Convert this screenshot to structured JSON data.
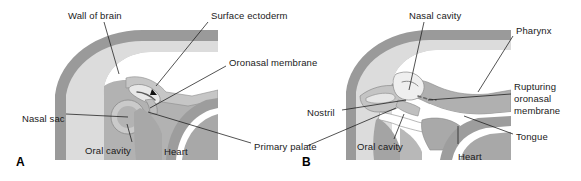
{
  "figure": {
    "type": "anatomical-diagram",
    "background_color": "#ffffff",
    "panel_count": 2
  },
  "colors": {
    "tissue_dark_gray": "#9a9a9a",
    "tissue_mid_gray": "#b5b5b5",
    "tissue_light_gray": "#cfcfcf",
    "tissue_pale": "#e4e4e4",
    "cavity_white": "#ffffff",
    "outline": "#6f6f6f",
    "leader_line": "#1a1a1a",
    "text": "#1a1a1a"
  },
  "panels": [
    {
      "letter": "A",
      "letter_x": 16,
      "letter_y": 155,
      "labels": [
        {
          "text": "Wall of brain",
          "x": 68,
          "y": 10,
          "anchor": "left"
        },
        {
          "text": "Surface ectoderm",
          "x": 211,
          "y": 10,
          "anchor": "left"
        },
        {
          "text": "Oronasal membrane",
          "x": 229,
          "y": 57,
          "anchor": "left"
        },
        {
          "text": "Nasal sac",
          "x": 22,
          "y": 113,
          "anchor": "left"
        },
        {
          "text": "Oral cavity",
          "x": 85,
          "y": 145,
          "anchor": "left"
        },
        {
          "text": "Heart",
          "x": 164,
          "y": 146,
          "anchor": "left"
        },
        {
          "text": "Primary palate",
          "x": 254,
          "y": 141,
          "anchor": "left"
        }
      ]
    },
    {
      "letter": "B",
      "letter_x": 302,
      "letter_y": 155,
      "labels": [
        {
          "text": "Nasal cavity",
          "x": 409,
          "y": 10,
          "anchor": "left"
        },
        {
          "text": "Pharynx",
          "x": 516,
          "y": 25,
          "anchor": "left"
        },
        {
          "text": "Rupturing",
          "x": 514,
          "y": 81,
          "anchor": "left"
        },
        {
          "text": "oronasal",
          "x": 514,
          "y": 93,
          "anchor": "left"
        },
        {
          "text": "membrane",
          "x": 514,
          "y": 105,
          "anchor": "left"
        },
        {
          "text": "Nostril",
          "x": 307,
          "y": 107,
          "anchor": "left"
        },
        {
          "text": "Oral cavity",
          "x": 357,
          "y": 141,
          "anchor": "left"
        },
        {
          "text": "Tongue",
          "x": 516,
          "y": 131,
          "anchor": "left"
        },
        {
          "text": "Heart",
          "x": 458,
          "y": 151,
          "anchor": "left"
        }
      ]
    }
  ]
}
